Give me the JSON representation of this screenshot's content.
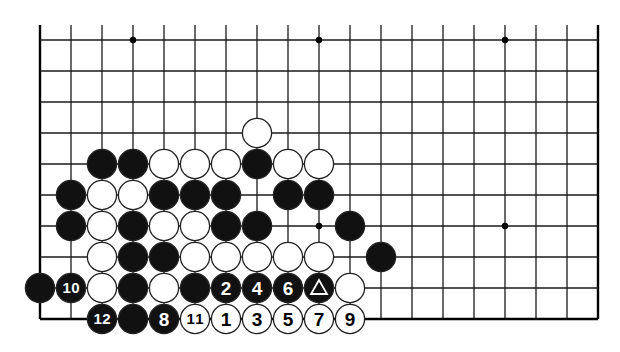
{
  "diagram": {
    "type": "go-board",
    "grid": {
      "cols": 19,
      "rows_visible": 10,
      "origin_x": 40,
      "origin_y": 40,
      "spacing_x": 31,
      "spacing_y": 31,
      "top_edge_open": true,
      "line_color": "#1a1a1a",
      "edge_color": "#000000"
    },
    "star_points": [
      {
        "col": 3,
        "row": 0
      },
      {
        "col": 9,
        "row": 0
      },
      {
        "col": 15,
        "row": 0
      },
      {
        "col": 9,
        "row": 6
      },
      {
        "col": 15,
        "row": 6
      }
    ],
    "colors": {
      "black": "#111111",
      "white": "#ffffff",
      "stone_outline": "#222222"
    },
    "stones": [
      {
        "col": 7,
        "row": 3,
        "color": "white"
      },
      {
        "col": 2,
        "row": 4,
        "color": "black"
      },
      {
        "col": 3,
        "row": 4,
        "color": "black"
      },
      {
        "col": 4,
        "row": 4,
        "color": "white"
      },
      {
        "col": 5,
        "row": 4,
        "color": "white"
      },
      {
        "col": 6,
        "row": 4,
        "color": "white"
      },
      {
        "col": 7,
        "row": 4,
        "color": "black"
      },
      {
        "col": 8,
        "row": 4,
        "color": "white"
      },
      {
        "col": 9,
        "row": 4,
        "color": "white"
      },
      {
        "col": 1,
        "row": 5,
        "color": "black"
      },
      {
        "col": 2,
        "row": 5,
        "color": "white"
      },
      {
        "col": 3,
        "row": 5,
        "color": "white"
      },
      {
        "col": 4,
        "row": 5,
        "color": "black"
      },
      {
        "col": 5,
        "row": 5,
        "color": "black"
      },
      {
        "col": 6,
        "row": 5,
        "color": "black"
      },
      {
        "col": 8,
        "row": 5,
        "color": "black"
      },
      {
        "col": 9,
        "row": 5,
        "color": "black"
      },
      {
        "col": 1,
        "row": 6,
        "color": "black"
      },
      {
        "col": 2,
        "row": 6,
        "color": "white"
      },
      {
        "col": 3,
        "row": 6,
        "color": "black"
      },
      {
        "col": 4,
        "row": 6,
        "color": "white"
      },
      {
        "col": 5,
        "row": 6,
        "color": "white"
      },
      {
        "col": 6,
        "row": 6,
        "color": "black"
      },
      {
        "col": 7,
        "row": 6,
        "color": "black"
      },
      {
        "col": 10,
        "row": 6,
        "color": "black"
      },
      {
        "col": 2,
        "row": 7,
        "color": "white"
      },
      {
        "col": 3,
        "row": 7,
        "color": "black"
      },
      {
        "col": 4,
        "row": 7,
        "color": "black"
      },
      {
        "col": 5,
        "row": 7,
        "color": "white"
      },
      {
        "col": 6,
        "row": 7,
        "color": "white"
      },
      {
        "col": 7,
        "row": 7,
        "color": "white"
      },
      {
        "col": 8,
        "row": 7,
        "color": "white"
      },
      {
        "col": 9,
        "row": 7,
        "color": "white"
      },
      {
        "col": 11,
        "row": 7,
        "color": "black"
      },
      {
        "col": 0,
        "row": 8,
        "color": "black"
      },
      {
        "col": 1,
        "row": 8,
        "color": "black",
        "label": "10"
      },
      {
        "col": 2,
        "row": 8,
        "color": "white"
      },
      {
        "col": 3,
        "row": 8,
        "color": "black"
      },
      {
        "col": 4,
        "row": 8,
        "color": "white"
      },
      {
        "col": 5,
        "row": 8,
        "color": "black"
      },
      {
        "col": 6,
        "row": 8,
        "color": "black",
        "label": "2"
      },
      {
        "col": 7,
        "row": 8,
        "color": "black",
        "label": "4"
      },
      {
        "col": 8,
        "row": 8,
        "color": "black",
        "label": "6"
      },
      {
        "col": 9,
        "row": 8,
        "color": "black",
        "marker": "triangle"
      },
      {
        "col": 10,
        "row": 8,
        "color": "white"
      },
      {
        "col": 2,
        "row": 9,
        "color": "black",
        "label": "12"
      },
      {
        "col": 3,
        "row": 9,
        "color": "black"
      },
      {
        "col": 4,
        "row": 9,
        "color": "black",
        "label": "8"
      },
      {
        "col": 5,
        "row": 9,
        "color": "white",
        "label": "11"
      },
      {
        "col": 6,
        "row": 9,
        "color": "white",
        "label": "1"
      },
      {
        "col": 7,
        "row": 9,
        "color": "white",
        "label": "3"
      },
      {
        "col": 8,
        "row": 9,
        "color": "white",
        "label": "5"
      },
      {
        "col": 9,
        "row": 9,
        "color": "white",
        "label": "7"
      },
      {
        "col": 10,
        "row": 9,
        "color": "white",
        "label": "9"
      }
    ]
  }
}
